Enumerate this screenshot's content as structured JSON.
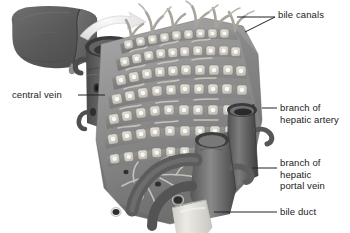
{
  "figure": {
    "background_color": "#ffffff",
    "label_text_color": "#1b1b1b",
    "leader_line_color": "#222222",
    "palette": {
      "liver_organ_dark": "#5d5d5d",
      "liver_organ_mid": "#6e6e6e",
      "tissue_mid_gray": "#8f8f8f",
      "tissue_light_gray": "#b9b9b9",
      "hepatocyte_pale": "#dedad2",
      "vessel_dark": "#545454",
      "vessel_mid": "#767676",
      "bile_duct_pale": "#e6e4de",
      "arrow_pale": "#efefef"
    }
  },
  "labels": [
    {
      "id": "bile-canals",
      "text": "bile canals",
      "x": 278,
      "y": 9,
      "lines": 1
    },
    {
      "id": "central-vein",
      "text": "central vein",
      "x": 12,
      "y": 89,
      "lines": 1
    },
    {
      "id": "branch-hepatic-artery",
      "text": "branch of\nhepatic artery",
      "x": 280,
      "y": 102,
      "lines": 2
    },
    {
      "id": "branch-hepatic-portal-vein",
      "text": "branch of\nhepatic\nportal vein",
      "x": 280,
      "y": 157,
      "lines": 3
    },
    {
      "id": "bile-duct",
      "text": "bile duct",
      "x": 280,
      "y": 206,
      "lines": 1
    }
  ],
  "structures": [
    {
      "id": "whole-liver",
      "name": "whole liver organ silhouette"
    },
    {
      "id": "magnify-arrow",
      "name": "curved magnification arrow"
    },
    {
      "id": "liver-lobule",
      "name": "liver lobule block"
    },
    {
      "id": "central-vein-cylinder",
      "name": "central vein cut cylinder"
    },
    {
      "id": "hepatocyte-plates",
      "name": "plates of hepatocytes"
    },
    {
      "id": "bile-canaliculi",
      "name": "bile canaliculi projections"
    },
    {
      "id": "hepatic-artery-branch",
      "name": "hepatic artery branch vessel"
    },
    {
      "id": "portal-vein-branch",
      "name": "hepatic portal vein branch vessel"
    },
    {
      "id": "bile-duct-tube",
      "name": "bile duct pale tube"
    },
    {
      "id": "sinusoid-network",
      "name": "sinusoid vessel network"
    }
  ]
}
